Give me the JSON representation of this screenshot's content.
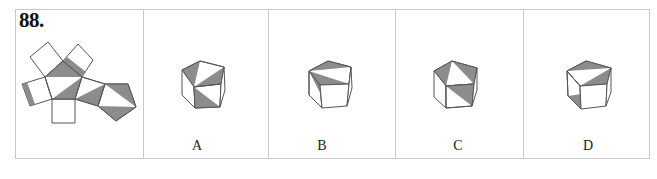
{
  "question": {
    "number": "88."
  },
  "options": [
    {
      "id": "A",
      "label": "A"
    },
    {
      "id": "B",
      "label": "B"
    },
    {
      "id": "C",
      "label": "C"
    },
    {
      "id": "D",
      "label": "D"
    }
  ],
  "colors": {
    "border": "#c8c8c8",
    "line": "#555555",
    "shade": "#8c8c8c",
    "background": "#ffffff"
  }
}
